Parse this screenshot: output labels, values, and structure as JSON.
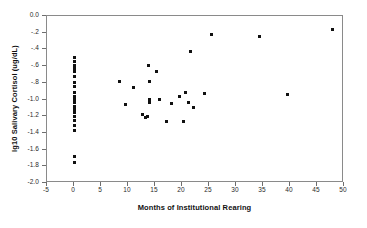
{
  "chart_data": {
    "type": "scatter",
    "title": "",
    "xlabel": "Months of Institutional Rearing",
    "ylabel": "lg10 Salivary Cortisol (ug/dL)",
    "xlim": [
      -5,
      50
    ],
    "ylim": [
      -2.0,
      0.0
    ],
    "grid": false,
    "legend": null,
    "marker": "filled-square",
    "marker_color": "#111111",
    "xticks": [
      -5,
      0,
      5,
      10,
      15,
      20,
      25,
      30,
      35,
      40,
      45,
      50
    ],
    "xtick_labels": [
      "-5",
      "0",
      "5",
      "10",
      "15",
      "20",
      "25",
      "30",
      "35",
      "40",
      "45",
      "50"
    ],
    "yticks": [
      0.0,
      -0.2,
      -0.4,
      -0.6,
      -0.8,
      -1.0,
      -1.2,
      -1.4,
      -1.6,
      -1.8,
      -2.0
    ],
    "ytick_labels": [
      "0.0",
      "-.2",
      "-.4",
      "-.6",
      "-.8",
      "-1.0",
      "-1.2",
      "-1.4",
      "-1.6",
      "-1.8",
      "-2.0"
    ],
    "points": [
      {
        "x": 0,
        "y": -0.5
      },
      {
        "x": 0,
        "y": -0.55
      },
      {
        "x": 0,
        "y": -0.59
      },
      {
        "x": 0,
        "y": -0.63
      },
      {
        "x": 0,
        "y": -0.67
      },
      {
        "x": 0,
        "y": -0.72
      },
      {
        "x": 0,
        "y": -0.8
      },
      {
        "x": 0,
        "y": -0.85
      },
      {
        "x": 0,
        "y": -0.92
      },
      {
        "x": 0,
        "y": -0.96
      },
      {
        "x": 0,
        "y": -1.0
      },
      {
        "x": 0,
        "y": -1.04
      },
      {
        "x": 0,
        "y": -1.08
      },
      {
        "x": 0,
        "y": -1.12
      },
      {
        "x": 0,
        "y": -1.16
      },
      {
        "x": 0,
        "y": -1.2
      },
      {
        "x": 0,
        "y": -1.25
      },
      {
        "x": 0,
        "y": -1.31
      },
      {
        "x": 0,
        "y": -1.37
      },
      {
        "x": 0,
        "y": -1.68
      },
      {
        "x": 0,
        "y": -1.76
      },
      {
        "x": 8.4,
        "y": -0.79
      },
      {
        "x": 9.6,
        "y": -1.06
      },
      {
        "x": 11.0,
        "y": -0.86
      },
      {
        "x": 12.6,
        "y": -1.18
      },
      {
        "x": 13.2,
        "y": -1.22
      },
      {
        "x": 13.6,
        "y": -1.2
      },
      {
        "x": 13.8,
        "y": -0.59
      },
      {
        "x": 13.9,
        "y": -0.79
      },
      {
        "x": 14.0,
        "y": -1.0
      },
      {
        "x": 14.0,
        "y": -1.04
      },
      {
        "x": 15.3,
        "y": -0.66
      },
      {
        "x": 15.9,
        "y": -1.0
      },
      {
        "x": 17.2,
        "y": -1.26
      },
      {
        "x": 18.0,
        "y": -1.05
      },
      {
        "x": 19.6,
        "y": -0.96
      },
      {
        "x": 20.2,
        "y": -1.26
      },
      {
        "x": 20.6,
        "y": -0.92
      },
      {
        "x": 21.2,
        "y": -1.04
      },
      {
        "x": 21.6,
        "y": -0.42
      },
      {
        "x": 22.2,
        "y": -1.09
      },
      {
        "x": 24.2,
        "y": -0.93
      },
      {
        "x": 25.5,
        "y": -0.22
      },
      {
        "x": 34.3,
        "y": -0.24
      },
      {
        "x": 39.6,
        "y": -0.94
      },
      {
        "x": 47.8,
        "y": -0.16
      }
    ]
  }
}
